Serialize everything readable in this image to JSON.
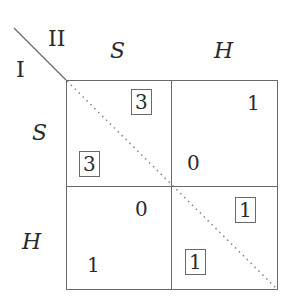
{
  "players": {
    "row_player": "I",
    "column_player": "II"
  },
  "column_strategies": [
    "S",
    "H"
  ],
  "row_strategies": [
    "S",
    "H"
  ],
  "cells": [
    {
      "row": "S",
      "col": "S",
      "payoff_I": "3",
      "payoff_II": "3",
      "boxed_I": true,
      "boxed_II": true
    },
    {
      "row": "S",
      "col": "H",
      "payoff_I": "0",
      "payoff_II": "1",
      "boxed_I": false,
      "boxed_II": false
    },
    {
      "row": "H",
      "col": "S",
      "payoff_I": "1",
      "payoff_II": "0",
      "boxed_I": false,
      "boxed_II": false
    },
    {
      "row": "H",
      "col": "H",
      "payoff_I": "1",
      "payoff_II": "1",
      "boxed_I": true,
      "boxed_II": true
    }
  ],
  "colors": {
    "line": "#6a6a6a",
    "text": "#2a2a2a",
    "dotted_diagonal": "#8a8a8a"
  }
}
